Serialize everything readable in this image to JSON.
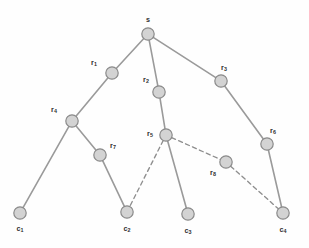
{
  "diagram": {
    "width": 309,
    "height": 248,
    "background_color": "#fefefe",
    "node_fill_color": "#d3d3d3",
    "node_stroke_color": "#8a8a8a",
    "edge_solid_color": "#9a9a9a",
    "edge_dashed_color": "#8e8e8e",
    "label_color": "#2e2e2e",
    "node_radius": 6.2,
    "nodes": [
      {
        "id": "s",
        "label_main": "s",
        "label_sub": "",
        "x": 148,
        "y": 34,
        "label_x": 148,
        "label_y": 20,
        "label_anchor": "center",
        "kind": "root"
      },
      {
        "id": "r1",
        "label_main": "r",
        "label_sub": "1",
        "x": 112,
        "y": 73,
        "label_x": 94,
        "label_y": 63,
        "label_anchor": "center",
        "kind": "internal"
      },
      {
        "id": "r2",
        "label_main": "r",
        "label_sub": "2",
        "x": 159,
        "y": 92,
        "label_x": 146,
        "label_y": 80,
        "label_anchor": "center",
        "kind": "internal"
      },
      {
        "id": "r3",
        "label_main": "r",
        "label_sub": "3",
        "x": 221,
        "y": 81,
        "label_x": 224,
        "label_y": 68,
        "label_anchor": "center",
        "kind": "internal"
      },
      {
        "id": "r4",
        "label_main": "r",
        "label_sub": "4",
        "x": 72,
        "y": 121,
        "label_x": 54,
        "label_y": 110,
        "label_anchor": "center",
        "kind": "internal"
      },
      {
        "id": "r5",
        "label_main": "r",
        "label_sub": "5",
        "x": 166,
        "y": 135,
        "label_x": 150,
        "label_y": 134,
        "label_anchor": "center",
        "kind": "internal"
      },
      {
        "id": "r6",
        "label_main": "r",
        "label_sub": "6",
        "x": 267,
        "y": 144,
        "label_x": 273,
        "label_y": 131,
        "label_anchor": "center",
        "kind": "internal"
      },
      {
        "id": "r7",
        "label_main": "r",
        "label_sub": "7",
        "x": 100,
        "y": 155,
        "label_x": 113,
        "label_y": 146,
        "label_anchor": "center",
        "kind": "internal"
      },
      {
        "id": "r8",
        "label_main": "r",
        "label_sub": "8",
        "x": 226,
        "y": 162,
        "label_x": 213,
        "label_y": 173,
        "label_anchor": "center",
        "kind": "internal"
      },
      {
        "id": "c1",
        "label_main": "c",
        "label_sub": "1",
        "x": 20,
        "y": 213,
        "label_x": 20,
        "label_y": 229,
        "label_anchor": "center",
        "kind": "leaf"
      },
      {
        "id": "c2",
        "label_main": "c",
        "label_sub": "2",
        "x": 127,
        "y": 212,
        "label_x": 127,
        "label_y": 229,
        "label_anchor": "center",
        "kind": "leaf"
      },
      {
        "id": "c3",
        "label_main": "c",
        "label_sub": "3",
        "x": 188,
        "y": 214,
        "label_x": 188,
        "label_y": 231,
        "label_anchor": "center",
        "kind": "leaf"
      },
      {
        "id": "c4",
        "label_main": "c",
        "label_sub": "4",
        "x": 283,
        "y": 213,
        "label_x": 283,
        "label_y": 230,
        "label_anchor": "center",
        "kind": "leaf"
      }
    ],
    "edges": [
      {
        "from": "s",
        "to": "r1",
        "style": "solid"
      },
      {
        "from": "s",
        "to": "r2",
        "style": "solid"
      },
      {
        "from": "s",
        "to": "r3",
        "style": "solid"
      },
      {
        "from": "r1",
        "to": "r4",
        "style": "solid"
      },
      {
        "from": "r2",
        "to": "r5",
        "style": "solid"
      },
      {
        "from": "r3",
        "to": "r6",
        "style": "solid"
      },
      {
        "from": "r4",
        "to": "c1",
        "style": "solid"
      },
      {
        "from": "r4",
        "to": "r7",
        "style": "solid"
      },
      {
        "from": "r7",
        "to": "c2",
        "style": "solid"
      },
      {
        "from": "r5",
        "to": "c3",
        "style": "solid"
      },
      {
        "from": "r6",
        "to": "c4",
        "style": "solid"
      },
      {
        "from": "r5",
        "to": "c2",
        "style": "dashed"
      },
      {
        "from": "r5",
        "to": "r8",
        "style": "dashed"
      },
      {
        "from": "r8",
        "to": "c4",
        "style": "dashed"
      }
    ]
  }
}
